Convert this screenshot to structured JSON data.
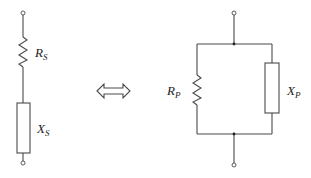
{
  "diagram": {
    "type": "circuit-equivalence",
    "series_circuit": {
      "components": [
        {
          "kind": "resistor",
          "symbol": "R",
          "subscript": "S"
        },
        {
          "kind": "reactance",
          "symbol": "X",
          "subscript": "S"
        }
      ]
    },
    "equivalence_symbol": "double-arrow",
    "parallel_circuit": {
      "components": [
        {
          "kind": "resistor",
          "symbol": "R",
          "subscript": "P"
        },
        {
          "kind": "reactance",
          "symbol": "X",
          "subscript": "P"
        }
      ]
    },
    "colors": {
      "line": "#4a4a4a",
      "text": "#222222",
      "background": "#ffffff"
    }
  }
}
